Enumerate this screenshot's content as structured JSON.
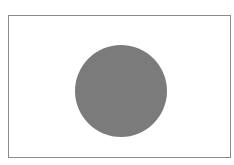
{
  "figure": {
    "caption": "",
    "frame": {
      "border_color": "#8a8a8a",
      "background": "#ffffff"
    },
    "shape": {
      "type": "circle",
      "fill": "#7b7b7b",
      "center": [
        121,
        91
      ],
      "radius": 46
    }
  }
}
